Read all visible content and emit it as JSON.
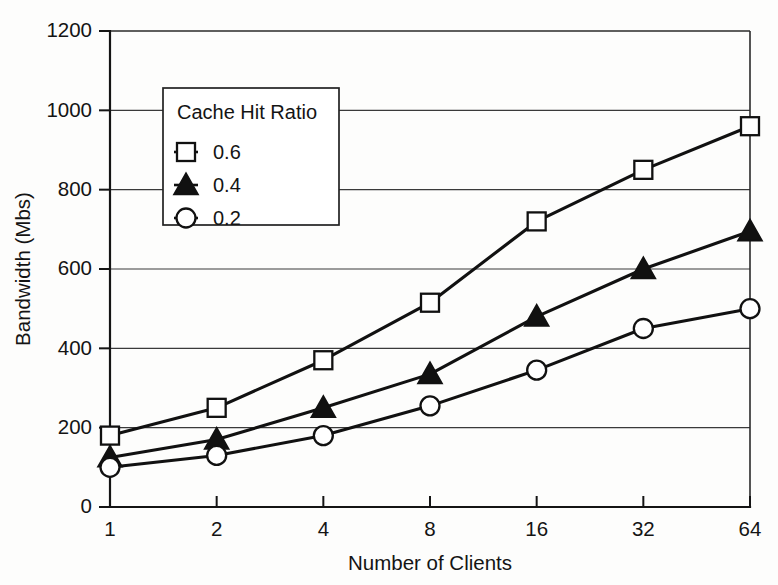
{
  "figure": {
    "background_color": "#fdfdfc",
    "ink_color": "#141414"
  },
  "chart_data": {
    "type": "line",
    "title": "",
    "xlabel": "Number of Clients",
    "ylabel": "Bandwidth (Mbs)",
    "x": [
      1,
      2,
      4,
      8,
      16,
      32,
      64
    ],
    "x_tick_labels": [
      "1",
      "2",
      "4",
      "8",
      "16",
      "32",
      "64"
    ],
    "x_scale": "log2-evenly-spaced",
    "y_tick_labels": [
      "0",
      "200",
      "400",
      "600",
      "800",
      "1000",
      "1200"
    ],
    "y_ticks": [
      0,
      200,
      400,
      600,
      800,
      1000,
      1200
    ],
    "ylim": [
      0,
      1200
    ],
    "grid": "horizontal",
    "legend_position": "upper-left-inside",
    "legend_title": "Cache Hit Ratio",
    "series": [
      {
        "name": "0.6",
        "marker": "open-square",
        "values": [
          180,
          250,
          370,
          515,
          720,
          850,
          960
        ]
      },
      {
        "name": "0.4",
        "marker": "filled-triangle",
        "values": [
          125,
          170,
          250,
          335,
          480,
          600,
          695
        ]
      },
      {
        "name": "0.2",
        "marker": "open-circle",
        "values": [
          100,
          130,
          180,
          255,
          345,
          450,
          500
        ]
      }
    ]
  },
  "axes": {
    "y_title": "Bandwidth (Mbs)",
    "x_title": "Number of Clients"
  },
  "legend": {
    "title": "Cache Hit Ratio",
    "entries": [
      {
        "label": "0.6",
        "marker": "open-square"
      },
      {
        "label": "0.4",
        "marker": "filled-triangle"
      },
      {
        "label": "0.2",
        "marker": "open-circle"
      }
    ]
  }
}
